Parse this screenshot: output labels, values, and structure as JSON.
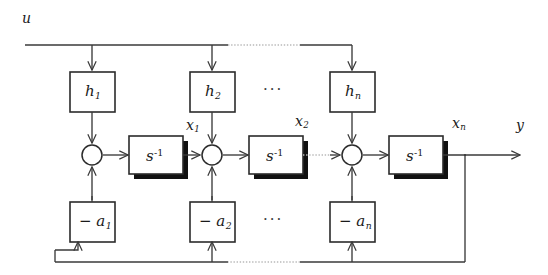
{
  "figure": {
    "type": "block-diagram",
    "background_color": "#ffffff",
    "line_color": "#3a3a3a",
    "shadow_color": "#111111",
    "dotted_color": "#b9b9b9"
  },
  "signals": {
    "input": "u",
    "output": "y",
    "states": [
      "x",
      "x",
      "x"
    ],
    "state_subs": [
      "1",
      "2",
      "n"
    ],
    "input_label": "u",
    "output_label": "y"
  },
  "labels": {
    "u": "u",
    "y": "y",
    "x1_base": "x",
    "x1_sub": "1",
    "x2_base": "x",
    "x2_sub": "2",
    "xn_base": "x",
    "xn_sub": "n",
    "ellipsis": "···"
  },
  "gain_blocks": [
    {
      "name": "h1",
      "base": "h",
      "sub": "1",
      "row": "top"
    },
    {
      "name": "h2",
      "base": "h",
      "sub": "2",
      "row": "top"
    },
    {
      "name": "hn",
      "base": "h",
      "sub": "n",
      "row": "top"
    }
  ],
  "integrator_blocks": [
    {
      "name": "integrator-1",
      "base": "s",
      "sup": "-1"
    },
    {
      "name": "integrator-2",
      "base": "s",
      "sup": "-1"
    },
    {
      "name": "integrator-n",
      "base": "s",
      "sup": "-1"
    }
  ],
  "feedback_blocks": [
    {
      "name": "a1",
      "base": "− a",
      "sub": "1",
      "row": "bottom"
    },
    {
      "name": "a2",
      "base": "− a",
      "sub": "2",
      "row": "bottom"
    },
    {
      "name": "an",
      "base": "− a",
      "sub": "n",
      "row": "bottom"
    }
  ],
  "summing_junctions": [
    {
      "name": "sum-1",
      "inputs": [
        "top",
        "bottom"
      ],
      "output": "right"
    },
    {
      "name": "sum-2",
      "inputs": [
        "top",
        "bottom",
        "left"
      ],
      "output": "right"
    },
    {
      "name": "sum-n",
      "inputs": [
        "top",
        "bottom",
        "left"
      ],
      "output": "right"
    }
  ],
  "buses": {
    "input_bus": "u",
    "feedback_bus": "y"
  }
}
